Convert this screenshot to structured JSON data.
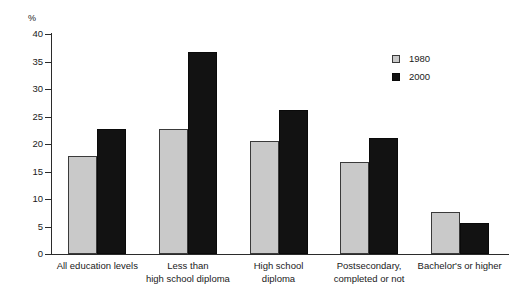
{
  "chart_data": {
    "type": "bar",
    "title": "",
    "subtitle": "",
    "xlabel": "",
    "ylabel": "%",
    "unit_label": "%",
    "ylim": [
      0,
      40
    ],
    "yticks": [
      0,
      5,
      10,
      15,
      20,
      25,
      30,
      35,
      40
    ],
    "ytick_labels": [
      "0",
      "5",
      "10",
      "15",
      "20",
      "25",
      "30",
      "35",
      "40"
    ],
    "grid": false,
    "legend_position": "top-right",
    "categories": [
      "All education levels",
      "Less than high school diploma",
      "High school diploma",
      "Postsecondary, completed or not",
      "Bachelor's or higher"
    ],
    "category_lines": [
      [
        "All education levels",
        ""
      ],
      [
        "Less than",
        "high school diploma"
      ],
      [
        "High school",
        "diploma"
      ],
      [
        "Postsecondary,",
        "completed or not"
      ],
      [
        "Bachelor's or higher",
        ""
      ]
    ],
    "series": [
      {
        "name": "1980",
        "color": "#c9c9c9",
        "values": [
          17.8,
          22.8,
          20.5,
          16.7,
          7.6
        ]
      },
      {
        "name": "2000",
        "color": "#121212",
        "values": [
          22.7,
          36.7,
          26.1,
          21.1,
          5.6
        ]
      }
    ]
  },
  "legend": {
    "items": [
      {
        "label": "1980",
        "swatch": "light-gray-square"
      },
      {
        "label": "2000",
        "swatch": "black-square"
      }
    ]
  }
}
